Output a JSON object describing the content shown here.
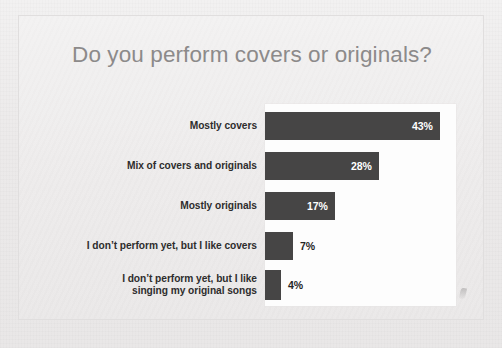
{
  "figure": {
    "title": "Do you perform covers or originals?",
    "caption_partial": ""
  },
  "colors": {
    "bar": "#464545",
    "title_text": "#8c8a8a",
    "label_text": "#2e2d2d",
    "plot_background": "#fdfdfd",
    "page_background": "#eceaea"
  },
  "chart_data": {
    "type": "bar",
    "orientation": "horizontal",
    "title": "Do you perform covers or originals?",
    "xlabel": "",
    "ylabel": "",
    "grid": false,
    "legend": "none",
    "value_suffix": "%",
    "xlim": [
      0,
      47
    ],
    "categories": [
      "Mostly covers",
      "Mix of covers and originals",
      "Mostly originals",
      "I don’t perform yet, but I like covers",
      "I don’t perform yet, but I like singing my original songs"
    ],
    "values": [
      43,
      28,
      17,
      7,
      4
    ],
    "value_labels": [
      "43%",
      "28%",
      "17%",
      "7%",
      "4%"
    ],
    "label_placement": [
      "inside",
      "inside",
      "inside",
      "outside",
      "outside"
    ]
  },
  "bars": [
    {
      "label_line1": "Mostly covers",
      "label_line2": "",
      "value": "43%",
      "width_pct": 91.5,
      "inside": true
    },
    {
      "label_line1": "Mix of covers and originals",
      "label_line2": "",
      "value": "28%",
      "width_pct": 59.5,
      "inside": true
    },
    {
      "label_line1": "Mostly originals",
      "label_line2": "",
      "value": "17%",
      "width_pct": 36.5,
      "inside": true
    },
    {
      "label_line1": "I don’t perform yet, but I like covers",
      "label_line2": "",
      "value": "7%",
      "width_pct": 14.7,
      "inside": false
    },
    {
      "label_line1": "I don’t perform yet, but I like",
      "label_line2": "singing my original songs",
      "value": "4%",
      "width_pct": 8.4,
      "inside": false
    }
  ]
}
